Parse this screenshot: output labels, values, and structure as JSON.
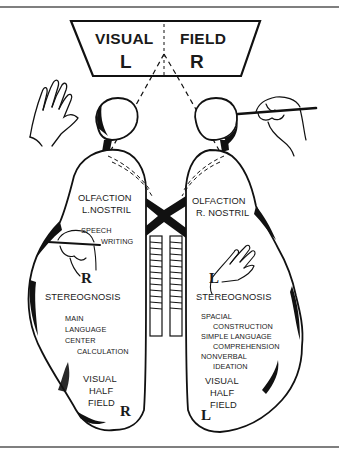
{
  "visual_field": {
    "title_left": "VISUAL",
    "title_right": "FIELD",
    "left_letter": "L",
    "right_letter": "R"
  },
  "left_hemisphere": {
    "olfaction": "OLFACTION",
    "nostril": "L.NOSTRIL",
    "speech": "SPEECH",
    "writing": "WRITING",
    "hand_letter": "R",
    "stereognosis": "STEREOGNOSIS",
    "functions": [
      "MAIN",
      "LANGUAGE",
      "CENTER",
      "CALCULATION"
    ],
    "visual_half_field": [
      "VISUAL",
      "HALF",
      "FIELD"
    ],
    "field_letter": "R"
  },
  "right_hemisphere": {
    "olfaction": "OLFACTION",
    "nostril": "R. NOSTRIL",
    "hand_letter": "L",
    "stereognosis": "STEREOGNOSIS",
    "functions": [
      "SPACIAL",
      "CONSTRUCTION",
      "SIMPLE LANGUAGE",
      "COMPREHENSION",
      "NONVERBAL",
      "IDEATION"
    ],
    "visual_half_field": [
      "VISUAL",
      "HALF",
      "FIELD"
    ],
    "field_letter": "L"
  },
  "colors": {
    "ink": "#111111",
    "background": "#ffffff",
    "rule": "#555555"
  }
}
